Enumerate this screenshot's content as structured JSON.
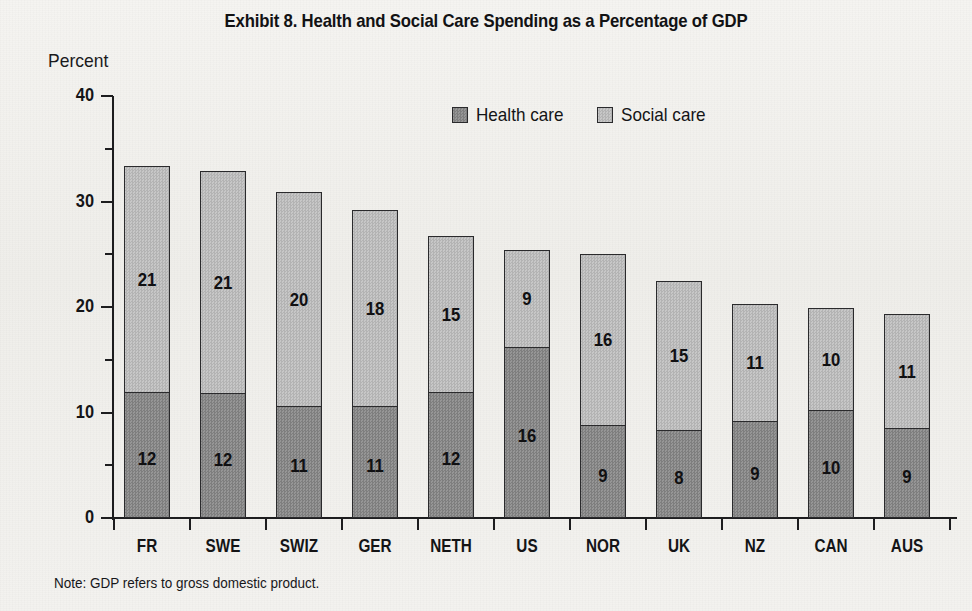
{
  "chart_data": {
    "type": "bar",
    "subtype": "stacked-vertical",
    "title": "Exhibit 8. Health and Social Care Spending as a Percentage of GDP",
    "xlabel": "",
    "ylabel": "Percent",
    "ylim": [
      0,
      40
    ],
    "yticks": [
      0,
      10,
      20,
      30,
      40
    ],
    "yticklabels": [
      "0",
      "10",
      "20",
      "30",
      "40"
    ],
    "yminor_step": 5,
    "grid": false,
    "legend_position": "top-center",
    "categories": [
      "FR",
      "SWE",
      "SWIZ",
      "GER",
      "NETH",
      "US",
      "NOR",
      "UK",
      "NZ",
      "CAN",
      "AUS"
    ],
    "series": [
      {
        "name": "Health care",
        "color": "#8a8a8a",
        "values": [
          11.8,
          11.7,
          10.5,
          10.5,
          11.8,
          16.1,
          8.7,
          8.2,
          9.0,
          10.1,
          8.4
        ],
        "labels": [
          "12",
          "12",
          "11",
          "11",
          "12",
          "16",
          "9",
          "8",
          "9",
          "10",
          "9"
        ]
      },
      {
        "name": "Social care",
        "color": "#bcbcbc",
        "values": [
          21.6,
          21.2,
          20.4,
          18.7,
          14.9,
          9.3,
          16.3,
          14.3,
          11.3,
          9.8,
          10.9
        ],
        "labels": [
          "21",
          "21",
          "20",
          "18",
          "15",
          "9",
          "16",
          "15",
          "11",
          "10",
          "11"
        ]
      }
    ],
    "totals": [
      33.4,
      32.9,
      30.9,
      29.2,
      26.7,
      25.4,
      25.0,
      22.5,
      20.3,
      19.9,
      19.3
    ],
    "note": "Note: GDP refers to gross domestic product."
  },
  "legend": {
    "items": [
      {
        "label": "Health care",
        "swatch": "dark-gray-swatch-icon"
      },
      {
        "label": "Social care",
        "swatch": "light-gray-swatch-icon"
      }
    ]
  },
  "colors": {
    "health_care": "#8a8a8a",
    "social_care": "#bcbcbc",
    "axis": "#1d1d1f",
    "text": "#17171a",
    "background": "#f2f1ee"
  }
}
